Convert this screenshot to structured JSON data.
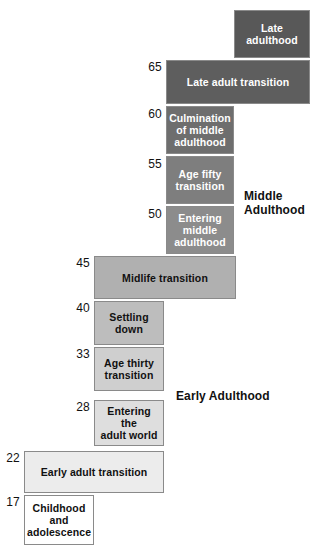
{
  "diagram": {
    "background_color": "#ffffff",
    "border_color": "#8a8a8a"
  },
  "stages": [
    {
      "id": "late-adulthood",
      "label": "Late\nadulthood",
      "start_age": null,
      "fill": "#585858",
      "text_color": "#ffffff",
      "x": 234,
      "y": 10,
      "width": 76,
      "height": 48
    },
    {
      "id": "late-adult-transition",
      "label": "Late adult transition",
      "start_age": "65",
      "fill": "#5e5e5e",
      "text_color": "#ffffff",
      "x": 166,
      "y": 60,
      "width": 144,
      "height": 44
    },
    {
      "id": "culmination-of-middle-adulthood",
      "label": "Culmination\nof middle\nadulthood",
      "start_age": "60",
      "fill": "#6e6e6e",
      "text_color": "#ffffff",
      "x": 166,
      "y": 106,
      "width": 68,
      "height": 48
    },
    {
      "id": "age-fifty-transition",
      "label": "Age fifty\ntransition",
      "start_age": "55",
      "fill": "#7e7e7e",
      "text_color": "#ffffff",
      "x": 166,
      "y": 156,
      "width": 68,
      "height": 48
    },
    {
      "id": "entering-middle-adulthood",
      "label": "Entering\nmiddle\nadulthood",
      "start_age": "50",
      "fill": "#8c8c8c",
      "text_color": "#ffffff",
      "x": 166,
      "y": 206,
      "width": 68,
      "height": 48
    },
    {
      "id": "midlife-transition",
      "label": "Midlife transition",
      "start_age": "45",
      "fill": "#b0b0b0",
      "text_color": "#111111",
      "x": 94,
      "y": 256,
      "width": 142,
      "height": 43
    },
    {
      "id": "settling-down",
      "label": "Settling\ndown",
      "start_age": "40",
      "fill": "#bdbdbd",
      "text_color": "#111111",
      "x": 94,
      "y": 301,
      "width": 70,
      "height": 44
    },
    {
      "id": "age-thirty-transition",
      "label": "Age thirty\ntransition",
      "start_age": "33",
      "fill": "#cfcfcf",
      "text_color": "#111111",
      "x": 94,
      "y": 347,
      "width": 70,
      "height": 44
    },
    {
      "id": "entering-the-adult-world",
      "label": "Entering the\nadult world",
      "start_age": "28",
      "fill": "#dedede",
      "text_color": "#111111",
      "x": 94,
      "y": 400,
      "width": 70,
      "height": 46
    },
    {
      "id": "early-adult-transition",
      "label": "Early adult transition",
      "start_age": "22",
      "fill": "#ececec",
      "text_color": "#111111",
      "x": 24,
      "y": 451,
      "width": 140,
      "height": 42
    },
    {
      "id": "childhood-and-adolescence",
      "label": "Childhood\nand\nadolescence",
      "start_age": "17",
      "fill": "#ffffff",
      "text_color": "#111111",
      "x": 24,
      "y": 495,
      "width": 70,
      "height": 50
    }
  ],
  "age_ticks": [
    {
      "value": "65",
      "x": 138,
      "y": 61,
      "width": 24
    },
    {
      "value": "60",
      "x": 138,
      "y": 108,
      "width": 24
    },
    {
      "value": "55",
      "x": 138,
      "y": 158,
      "width": 24
    },
    {
      "value": "50",
      "x": 138,
      "y": 208,
      "width": 24
    },
    {
      "value": "45",
      "x": 66,
      "y": 257,
      "width": 24
    },
    {
      "value": "40",
      "x": 66,
      "y": 302,
      "width": 24
    },
    {
      "value": "33",
      "x": 66,
      "y": 348,
      "width": 24
    },
    {
      "value": "28",
      "x": 66,
      "y": 401,
      "width": 24
    },
    {
      "value": "22",
      "x": 0,
      "y": 452,
      "width": 20
    },
    {
      "value": "17",
      "x": 0,
      "y": 496,
      "width": 20
    }
  ],
  "era_labels": [
    {
      "id": "middle-adulthood",
      "text": "Middle\nAdulthood",
      "x": 244,
      "y": 189
    },
    {
      "id": "early-adulthood",
      "text": "Early Adulthood",
      "x": 176,
      "y": 389
    }
  ]
}
